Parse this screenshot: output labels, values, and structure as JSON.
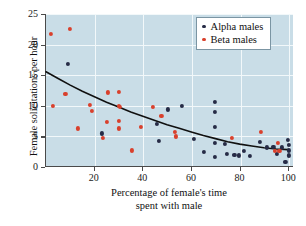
{
  "chart_data": {
    "type": "scatter",
    "title": "",
    "xlabel": "Percentage of female's time spent with male",
    "xlabel_line1": "Percentage of female's time",
    "xlabel_line2": "spent with male",
    "ylabel": "Female solicitations per hour",
    "xlim": [
      0,
      102
    ],
    "ylim": [
      0,
      25
    ],
    "xticks": [
      20,
      40,
      60,
      80,
      100
    ],
    "yticks": [
      0,
      5,
      10,
      15,
      20,
      25
    ],
    "xtick_labels": [
      "20",
      "40",
      "60",
      "80",
      "100"
    ],
    "ytick_labels": [
      "0",
      "5",
      "10",
      "15",
      "20",
      "25"
    ],
    "grid": true,
    "grid_color": "#f2f8fa",
    "plot_background": "#c9dde7",
    "legend_position": "top-right",
    "legend": [
      {
        "name": "Alpha males",
        "color": "#262b46",
        "marker": "circle"
      },
      {
        "name": "Beta males",
        "color": "#d9402c",
        "marker": "circle"
      }
    ],
    "series": [
      {
        "name": "Alpha males",
        "color": "#262b46",
        "points": [
          [
            9,
            16.8
          ],
          [
            23,
            5.5
          ],
          [
            45.5,
            7.0
          ],
          [
            46.5,
            4.3
          ],
          [
            50,
            9.4
          ],
          [
            56,
            10.0
          ],
          [
            61,
            4.6
          ],
          [
            65,
            2.4
          ],
          [
            69.5,
            10.7
          ],
          [
            69.5,
            9.0
          ],
          [
            69.5,
            6.5
          ],
          [
            69.5,
            4.0
          ],
          [
            69.5,
            1.7
          ],
          [
            73.5,
            3.8
          ],
          [
            74.5,
            2.1
          ],
          [
            77.5,
            2.0
          ],
          [
            79.5,
            1.9
          ],
          [
            81.5,
            2.6
          ],
          [
            84,
            1.8
          ],
          [
            88,
            4.1
          ],
          [
            91,
            3.2
          ],
          [
            93.5,
            3.3
          ],
          [
            95,
            2.2
          ],
          [
            97,
            3.2
          ],
          [
            98.5,
            0.8
          ],
          [
            99.5,
            4.4
          ],
          [
            100,
            3.6
          ],
          [
            100,
            2.7
          ],
          [
            100,
            1.9
          ]
        ]
      },
      {
        "name": "Beta males",
        "color": "#d9402c",
        "points": [
          [
            2,
            21.8
          ],
          [
            10,
            22.5
          ],
          [
            3,
            10.0
          ],
          [
            8,
            12.0
          ],
          [
            13,
            6.3
          ],
          [
            18,
            10.2
          ],
          [
            19,
            9.2
          ],
          [
            23.5,
            4.7
          ],
          [
            25,
            7.4
          ],
          [
            25.5,
            12.2
          ],
          [
            30,
            12.3
          ],
          [
            30,
            10.0
          ],
          [
            30.5,
            9.8
          ],
          [
            30,
            7.5
          ],
          [
            30,
            6.3
          ],
          [
            35.5,
            2.7
          ],
          [
            39,
            6.6
          ],
          [
            44,
            9.8
          ],
          [
            47.5,
            8.3
          ],
          [
            53,
            5.7
          ],
          [
            53.5,
            5.0
          ],
          [
            76.5,
            4.7
          ],
          [
            88.5,
            5.7
          ],
          [
            94,
            2.6
          ],
          [
            95.5,
            3.9
          ],
          [
            96,
            2.6
          ]
        ]
      }
    ],
    "trend_curve": {
      "description": "decaying fitted curve",
      "color": "#101010",
      "points": [
        [
          0,
          15.5
        ],
        [
          5,
          14.4
        ],
        [
          10,
          13.3
        ],
        [
          15,
          12.3
        ],
        [
          20,
          11.4
        ],
        [
          25,
          10.5
        ],
        [
          30,
          9.7
        ],
        [
          35,
          8.9
        ],
        [
          40,
          8.2
        ],
        [
          45,
          7.5
        ],
        [
          50,
          6.8
        ],
        [
          55,
          6.2
        ],
        [
          60,
          5.6
        ],
        [
          65,
          5.0
        ],
        [
          70,
          4.5
        ],
        [
          75,
          4.0
        ],
        [
          80,
          3.6
        ],
        [
          85,
          3.3
        ],
        [
          90,
          3.0
        ],
        [
          95,
          2.8
        ],
        [
          100,
          2.7
        ]
      ]
    }
  }
}
